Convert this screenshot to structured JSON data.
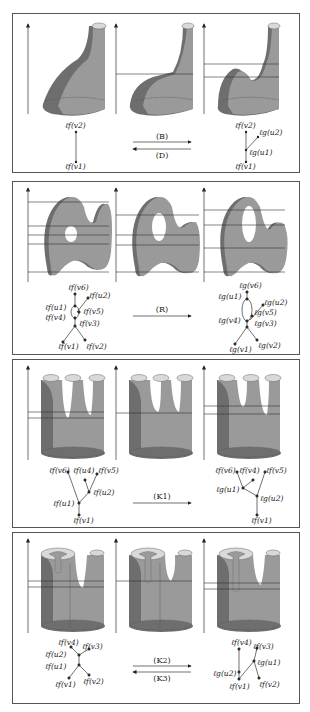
{
  "figure": {
    "panels": [
      {
        "id": "birth-death",
        "move_labels": [
          "(B)",
          "(D)"
        ],
        "arrows": "both",
        "left_graph": {
          "nodes": [
            {
              "label": "ℓf(v2)"
            },
            {
              "label": "ℓf(v1)"
            }
          ]
        },
        "right_graph": {
          "nodes": [
            {
              "label": "ℓf(v2)"
            },
            {
              "label": "ℓg(u2)"
            },
            {
              "label": "ℓg(u1)"
            },
            {
              "label": "ℓf(v1)"
            }
          ]
        }
      },
      {
        "id": "rotation",
        "move_labels": [
          "(R)"
        ],
        "arrows": "forward",
        "left_graph": {
          "nodes": [
            {
              "label": "ℓf(v6)"
            },
            {
              "label": "ℓf(u2)"
            },
            {
              "label": "ℓf(u1)"
            },
            {
              "label": "ℓf(v5)"
            },
            {
              "label": "ℓf(v4)"
            },
            {
              "label": "ℓf(v3)"
            },
            {
              "label": "ℓf(v1)"
            },
            {
              "label": "ℓf(v2)"
            }
          ]
        },
        "right_graph": {
          "nodes": [
            {
              "label": "ℓg(v6)"
            },
            {
              "label": "ℓg(u1)"
            },
            {
              "label": "ℓg(u2)"
            },
            {
              "label": "ℓg(v5)"
            },
            {
              "label": "ℓg(v4)"
            },
            {
              "label": "ℓg(v3)"
            },
            {
              "label": "ℓg(v1)"
            },
            {
              "label": "ℓg(v2)"
            }
          ]
        }
      },
      {
        "id": "k1",
        "move_labels": [
          "(K1)"
        ],
        "arrows": "forward",
        "left_graph": {
          "nodes": [
            {
              "label": "ℓf(v6)"
            },
            {
              "label": "ℓf(u4)"
            },
            {
              "label": "ℓf(v5)"
            },
            {
              "label": "ℓf(u2)"
            },
            {
              "label": "ℓf(u1)"
            },
            {
              "label": "ℓf(v1)"
            }
          ]
        },
        "right_graph": {
          "nodes": [
            {
              "label": "ℓf(v6)"
            },
            {
              "label": "ℓf(v4)"
            },
            {
              "label": "ℓf(v5)"
            },
            {
              "label": "ℓg(u1)"
            },
            {
              "label": "ℓg(u2)"
            },
            {
              "label": "ℓf(v1)"
            }
          ]
        }
      },
      {
        "id": "k2-k3",
        "move_labels": [
          "(K2)",
          "(K3)"
        ],
        "arrows": "both",
        "left_graph": {
          "nodes": [
            {
              "label": "ℓf(v4)"
            },
            {
              "label": "ℓf(v3)"
            },
            {
              "label": "ℓf(u2)"
            },
            {
              "label": "ℓf(u1)"
            },
            {
              "label": "ℓf(v1)"
            },
            {
              "label": "ℓf(v2)"
            }
          ]
        },
        "right_graph": {
          "nodes": [
            {
              "label": "ℓf(v4)"
            },
            {
              "label": "ℓf(v3)"
            },
            {
              "label": "ℓg(u1)"
            },
            {
              "label": "ℓg(u2)"
            },
            {
              "label": "ℓf(v1)"
            },
            {
              "label": "ℓf(v2)"
            }
          ]
        }
      }
    ],
    "colors": {
      "surface": "#9a9a9a",
      "shadow": "#6e6e6e",
      "cap": "#d9d9d9",
      "line": "#333333",
      "frame": "#555555"
    }
  }
}
